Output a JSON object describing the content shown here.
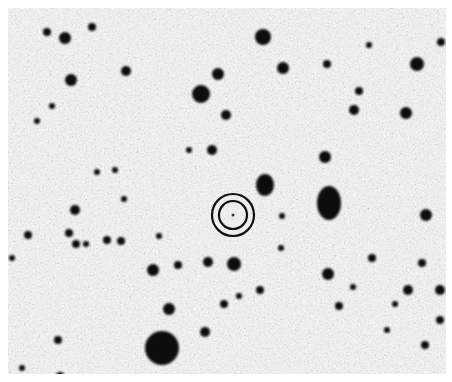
{
  "image": {
    "type": "astronomical-finding-chart",
    "style": "negative grayscale (dark sources on light sky)",
    "frame": {
      "x": 8,
      "y": 8,
      "width": 438,
      "height": 366
    },
    "colors": {
      "sky": "#d6d6d6",
      "source": "#0a0a0a",
      "marker": "#111111",
      "page": "#ffffff"
    }
  },
  "marker": {
    "shape": "double-circle",
    "cx": 233,
    "cy": 215,
    "outer_r": 21,
    "inner_r": 14,
    "stroke_width": 2.2
  },
  "sources": [
    {
      "x": 162,
      "y": 348,
      "r": 17
    },
    {
      "x": 329,
      "y": 203,
      "rx": 12,
      "ry": 17
    },
    {
      "x": 265,
      "y": 185,
      "rx": 9,
      "ry": 11
    },
    {
      "x": 201,
      "y": 94,
      "r": 9
    },
    {
      "x": 263,
      "y": 37,
      "r": 8
    },
    {
      "x": 65,
      "y": 38,
      "r": 6
    },
    {
      "x": 71,
      "y": 80,
      "r": 6
    },
    {
      "x": 47,
      "y": 32,
      "r": 4
    },
    {
      "x": 92,
      "y": 27,
      "r": 4
    },
    {
      "x": 126,
      "y": 71,
      "r": 5
    },
    {
      "x": 218,
      "y": 74,
      "r": 6
    },
    {
      "x": 226,
      "y": 115,
      "r": 5
    },
    {
      "x": 283,
      "y": 68,
      "r": 6
    },
    {
      "x": 327,
      "y": 64,
      "r": 4
    },
    {
      "x": 417,
      "y": 64,
      "r": 7
    },
    {
      "x": 441,
      "y": 42,
      "r": 4
    },
    {
      "x": 359,
      "y": 91,
      "r": 4
    },
    {
      "x": 406,
      "y": 113,
      "r": 6
    },
    {
      "x": 354,
      "y": 110,
      "r": 5
    },
    {
      "x": 325,
      "y": 157,
      "r": 6
    },
    {
      "x": 212,
      "y": 150,
      "r": 5
    },
    {
      "x": 426,
      "y": 215,
      "r": 6
    },
    {
      "x": 422,
      "y": 263,
      "r": 4
    },
    {
      "x": 372,
      "y": 258,
      "r": 4
    },
    {
      "x": 408,
      "y": 290,
      "r": 5
    },
    {
      "x": 328,
      "y": 274,
      "r": 6
    },
    {
      "x": 353,
      "y": 287,
      "r": 3
    },
    {
      "x": 339,
      "y": 306,
      "r": 4
    },
    {
      "x": 440,
      "y": 290,
      "r": 5
    },
    {
      "x": 425,
      "y": 345,
      "r": 4
    },
    {
      "x": 440,
      "y": 320,
      "r": 4
    },
    {
      "x": 75,
      "y": 210,
      "r": 5
    },
    {
      "x": 69,
      "y": 233,
      "r": 4
    },
    {
      "x": 76,
      "y": 244,
      "r": 4
    },
    {
      "x": 28,
      "y": 235,
      "r": 4
    },
    {
      "x": 107,
      "y": 240,
      "r": 4
    },
    {
      "x": 121,
      "y": 241,
      "r": 4
    },
    {
      "x": 86,
      "y": 244,
      "r": 3
    },
    {
      "x": 12,
      "y": 258,
      "r": 3
    },
    {
      "x": 208,
      "y": 262,
      "r": 5
    },
    {
      "x": 234,
      "y": 264,
      "r": 7
    },
    {
      "x": 153,
      "y": 270,
      "r": 6
    },
    {
      "x": 178,
      "y": 265,
      "r": 4
    },
    {
      "x": 260,
      "y": 290,
      "r": 4
    },
    {
      "x": 224,
      "y": 304,
      "r": 4
    },
    {
      "x": 239,
      "y": 296,
      "r": 3
    },
    {
      "x": 205,
      "y": 332,
      "r": 5
    },
    {
      "x": 169,
      "y": 309,
      "r": 6
    },
    {
      "x": 58,
      "y": 340,
      "r": 4
    },
    {
      "x": 60,
      "y": 376,
      "r": 4
    },
    {
      "x": 22,
      "y": 368,
      "r": 3
    },
    {
      "x": 281,
      "y": 248,
      "r": 3
    },
    {
      "x": 282,
      "y": 216,
      "r": 3
    },
    {
      "x": 159,
      "y": 236,
      "r": 3
    },
    {
      "x": 52,
      "y": 106,
      "r": 3
    },
    {
      "x": 37,
      "y": 121,
      "r": 3
    },
    {
      "x": 97,
      "y": 172,
      "r": 3
    },
    {
      "x": 115,
      "y": 170,
      "r": 3
    },
    {
      "x": 124,
      "y": 199,
      "r": 3
    },
    {
      "x": 189,
      "y": 150,
      "r": 3
    },
    {
      "x": 369,
      "y": 45,
      "r": 3
    },
    {
      "x": 387,
      "y": 330,
      "r": 3
    },
    {
      "x": 395,
      "y": 304,
      "r": 3
    }
  ]
}
